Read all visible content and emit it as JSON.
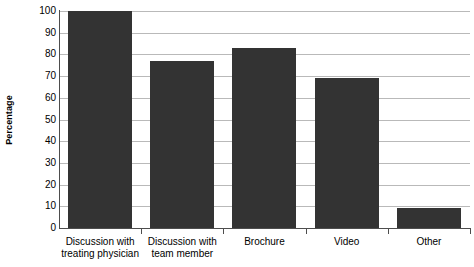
{
  "chart_data": {
    "type": "bar",
    "title": "",
    "xlabel": "",
    "ylabel": "Percentage",
    "ylim": [
      0,
      100
    ],
    "grid": true,
    "legend": false,
    "categories": [
      "Discussion with treating physician",
      "Discussion with team member",
      "Brochure",
      "Video",
      "Other"
    ],
    "category_lines": [
      [
        "Discussion with",
        "treating physician"
      ],
      [
        "Discussion with",
        "team member"
      ],
      [
        "Brochure"
      ],
      [
        "Video"
      ],
      [
        "Other"
      ]
    ],
    "values": [
      100,
      77,
      83,
      69,
      9
    ],
    "yticks": [
      100,
      90,
      80,
      70,
      60,
      50,
      40,
      30,
      20,
      10,
      0
    ],
    "ytick_labels": [
      "100",
      "90",
      "80",
      "70",
      "60",
      "50",
      "40",
      "30",
      "20",
      "10",
      "0"
    ],
    "bar_color": "#333333",
    "gridline_color": "#b9b9b9",
    "axis_color": "#4d4d4d",
    "background_color": "#ffffff"
  },
  "axis": {
    "y_title": "Percentage"
  }
}
